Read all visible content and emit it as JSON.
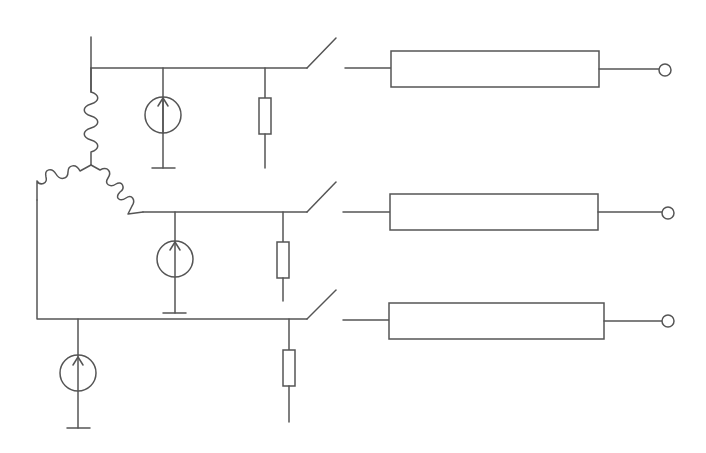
{
  "diagram": {
    "title": "Three-phase generator with current sources, shunt resistors, switches and transmission lines",
    "colors": {
      "line": "#555555",
      "background": "#ffffff"
    },
    "components": {
      "generator": {
        "type": "star-connected windings",
        "count": 3
      },
      "current_sources": [
        {
          "phase": 1,
          "icon": "current-source-up-arrow"
        },
        {
          "phase": 2,
          "icon": "current-source-up-arrow"
        },
        {
          "phase": 3,
          "icon": "current-source-up-arrow"
        }
      ],
      "resistors": [
        {
          "phase": 1
        },
        {
          "phase": 2
        },
        {
          "phase": 3
        }
      ],
      "switches": [
        {
          "phase": 1,
          "state": "open"
        },
        {
          "phase": 2,
          "state": "open"
        },
        {
          "phase": 3,
          "state": "open"
        }
      ],
      "lines": [
        {
          "phase": 1
        },
        {
          "phase": 2
        },
        {
          "phase": 3
        }
      ],
      "terminals": [
        {
          "phase": 1
        },
        {
          "phase": 2
        },
        {
          "phase": 3
        }
      ]
    }
  }
}
